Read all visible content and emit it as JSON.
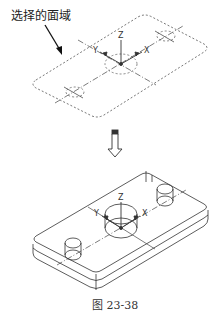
{
  "annotation": {
    "text": "选择的面域"
  },
  "top_figure": {
    "axes": {
      "z": "Z",
      "y": "Y",
      "x": "X"
    }
  },
  "bottom_figure": {
    "axes": {
      "z": "Z",
      "y": "Y",
      "x": "X"
    }
  },
  "caption": {
    "text": "图 23-38"
  },
  "colors": {
    "line": "#333333",
    "dashed": "#555555",
    "background": "#ffffff"
  }
}
